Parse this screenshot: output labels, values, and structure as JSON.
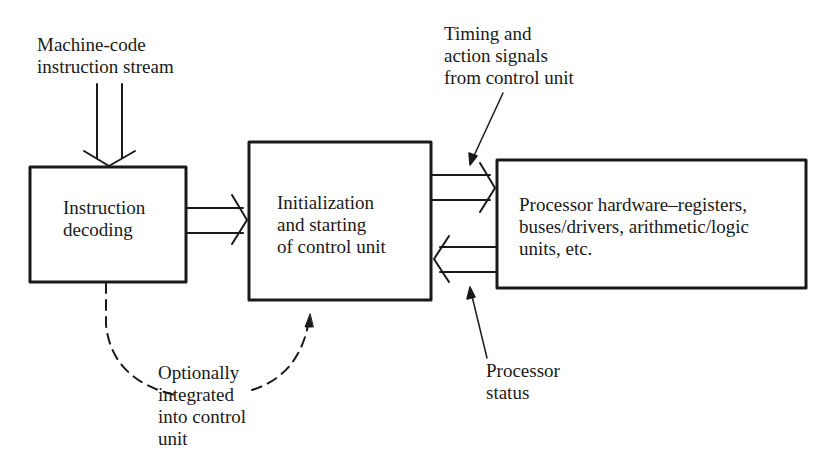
{
  "diagram": {
    "type": "block-diagram",
    "ink_color": "#1a1a1a",
    "background": "#ffffff",
    "blocks": [
      {
        "id": "instruction-decoding",
        "lines": [
          "Instruction",
          "decoding"
        ]
      },
      {
        "id": "initialization",
        "lines": [
          "Initialization",
          "and starting",
          "of control unit"
        ]
      },
      {
        "id": "processor-hardware",
        "lines": [
          "Processor hardware–registers,",
          "buses/drivers, arithmetic/logic",
          "units, etc."
        ]
      }
    ],
    "annotations": {
      "input_stream": [
        "Machine-code",
        "instruction stream"
      ],
      "timing_signals": [
        "Timing and",
        "action signals",
        "from control unit"
      ],
      "processor_status": [
        "Processor",
        "status"
      ],
      "optional_note": [
        "Optionally",
        "integrated",
        "into control",
        "unit"
      ]
    },
    "connections": [
      {
        "from": "input_stream",
        "to": "instruction-decoding",
        "style": "double-line-arrow"
      },
      {
        "from": "instruction-decoding",
        "to": "initialization",
        "style": "double-line-arrow"
      },
      {
        "from": "initialization",
        "to": "processor-hardware",
        "style": "double-line-arrow"
      },
      {
        "from": "processor-hardware",
        "to": "initialization",
        "style": "double-line-arrow"
      },
      {
        "from": "instruction-decoding",
        "to": "initialization",
        "style": "dashed-curve"
      }
    ]
  }
}
